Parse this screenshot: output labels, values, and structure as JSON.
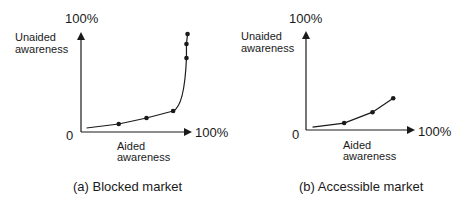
{
  "panels": [
    {
      "id": "a",
      "caption": "(a) Blocked market",
      "y_axis_label_line1": "Unaided",
      "y_axis_label_line2": "awareness",
      "y_max_label": "100%",
      "x_axis_label_line1": "Aided",
      "x_axis_label_line2": "awareness",
      "x_max_label": "100%",
      "origin_label": "0"
    },
    {
      "id": "b",
      "caption": "(b) Accessible market",
      "y_axis_label_line1": "Unaided",
      "y_axis_label_line2": "awareness",
      "y_max_label": "100%",
      "x_axis_label_line1": "Aided",
      "x_axis_label_line2": "awareness",
      "x_max_label": "100%",
      "origin_label": "0"
    }
  ],
  "chart_data": [
    {
      "type": "line",
      "title": "(a) Blocked market",
      "xlabel": "Aided awareness",
      "ylabel": "Unaided awareness",
      "xlim": [
        0,
        100
      ],
      "ylim": [
        0,
        100
      ],
      "grid": false,
      "series": [
        {
          "name": "Blocked market",
          "x": [
            5,
            34,
            59,
            83,
            95,
            95,
            96
          ],
          "y": [
            4,
            8,
            14,
            21,
            74,
            88,
            98
          ],
          "markers_at_index": [
            1,
            2,
            3,
            4,
            5,
            6
          ]
        }
      ]
    },
    {
      "type": "line",
      "title": "(b) Accessible market",
      "xlabel": "Aided awareness",
      "ylabel": "Unaided awareness",
      "xlim": [
        0,
        100
      ],
      "ylim": [
        0,
        100
      ],
      "grid": false,
      "series": [
        {
          "name": "Accessible market",
          "x": [
            6,
            35,
            61,
            80
          ],
          "y": [
            3,
            7,
            18,
            32
          ],
          "markers_at_index": [
            1,
            2,
            3
          ]
        }
      ]
    }
  ]
}
